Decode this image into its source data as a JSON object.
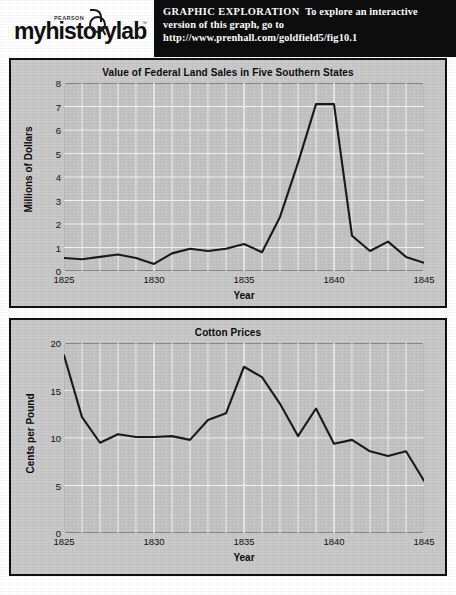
{
  "header": {
    "logo": {
      "brand_small": "PEARSON",
      "wordmark": "myhistorylab",
      "trademark": "™",
      "icon": "magnifying-glass-icon"
    },
    "promo": {
      "kicker": "GRAPHIC EXPLORATION",
      "line1_rest": "To explore an interactive",
      "line2": "version of this graph, go to",
      "url": "http://www.prenhall.com/goldfield5/fig10.1"
    }
  },
  "colors": {
    "panel_background": "#c9c9c9",
    "plot_background": "#c4c4c4",
    "gridline": "#f2f2f2",
    "data_line": "#1a1a1a",
    "frame": "#111111",
    "promo_background": "#0d0d0d",
    "promo_text": "#ffffff"
  },
  "chart_data": [
    {
      "type": "line",
      "title": "Value of Federal Land Sales in Five Southern States",
      "xlabel": "Year",
      "ylabel": "Millions of Dollars",
      "xlim": [
        1825,
        1845
      ],
      "ylim": [
        0,
        8
      ],
      "xticks": [
        1825,
        1830,
        1835,
        1840,
        1845
      ],
      "xtick_labels": [
        "1825",
        "1830",
        "1835",
        "1840",
        "1845"
      ],
      "yticks": [
        0,
        1,
        2,
        3,
        4,
        5,
        6,
        7,
        8
      ],
      "ytick_labels": [
        "0",
        "1",
        "2",
        "3",
        "4",
        "5",
        "6",
        "7",
        "8"
      ],
      "grid": true,
      "grid_x_step": 1,
      "grid_y_step": 1,
      "legend": "none",
      "x": [
        1825,
        1826,
        1827,
        1828,
        1829,
        1830,
        1831,
        1832,
        1833,
        1834,
        1835,
        1836,
        1837,
        1838,
        1839,
        1840,
        1841,
        1842,
        1843,
        1844,
        1845
      ],
      "values": [
        0.55,
        0.5,
        0.6,
        0.7,
        0.55,
        0.3,
        0.75,
        0.95,
        0.85,
        0.95,
        1.15,
        0.8,
        2.3,
        4.6,
        7.1,
        7.1,
        1.5,
        0.85,
        1.25,
        0.6,
        0.35
      ]
    },
    {
      "type": "line",
      "title": "Cotton Prices",
      "xlabel": "Year",
      "ylabel": "Cents per Pound",
      "xlim": [
        1825,
        1845
      ],
      "ylim": [
        0,
        20
      ],
      "xticks": [
        1825,
        1830,
        1835,
        1840,
        1845
      ],
      "xtick_labels": [
        "1825",
        "1830",
        "1835",
        "1840",
        "1845"
      ],
      "yticks": [
        0,
        5,
        10,
        15,
        20
      ],
      "ytick_labels": [
        "0",
        "5",
        "10",
        "15",
        "20"
      ],
      "grid": true,
      "grid_x_step": 1,
      "grid_y_step": 5,
      "legend": "none",
      "x": [
        1825,
        1826,
        1827,
        1828,
        1829,
        1830,
        1831,
        1832,
        1833,
        1834,
        1835,
        1836,
        1837,
        1838,
        1839,
        1840,
        1841,
        1842,
        1843,
        1844,
        1845
      ],
      "values": [
        18.7,
        12.2,
        9.5,
        10.4,
        10.1,
        10.1,
        10.2,
        9.8,
        11.9,
        12.6,
        17.5,
        16.4,
        13.6,
        10.2,
        13.1,
        9.4,
        9.8,
        8.6,
        8.1,
        8.6,
        5.5
      ]
    }
  ]
}
